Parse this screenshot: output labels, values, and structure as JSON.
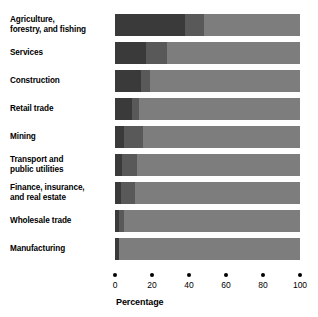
{
  "chart_data": {
    "type": "bar",
    "subtype": "stacked-horizontal-100",
    "title": "",
    "xlabel": "Percentage",
    "ylabel": "",
    "xlim": [
      0,
      100
    ],
    "grid": false,
    "legend": "none",
    "tick_values": [
      0,
      20,
      40,
      60,
      80,
      100
    ],
    "tick_labels": [
      "0",
      "20",
      "40",
      "60",
      "80",
      "100"
    ],
    "categories": [
      "Agriculture,\nforestry, and fishing",
      "Services",
      "Construction",
      "Retail trade",
      "Mining",
      "Transport and\npublic utilities",
      "Finance, insurance,\nand real estate",
      "Wholesale trade",
      "Manufacturing"
    ],
    "series": [
      {
        "name": "segment-1",
        "color": "#3a3a3a",
        "values": [
          38,
          17,
          14,
          9,
          5,
          4,
          3,
          2,
          2
        ]
      },
      {
        "name": "segment-2",
        "color": "#595959",
        "values": [
          10,
          11,
          5,
          4,
          10,
          8,
          8,
          3,
          0
        ]
      },
      {
        "name": "segment-3",
        "color": "#7d7d7d",
        "values": [
          52,
          72,
          81,
          87,
          85,
          88,
          89,
          95,
          98
        ]
      }
    ]
  },
  "axis": {
    "title": "Percentage",
    "ticks": [
      {
        "value": 0,
        "label": "0"
      },
      {
        "value": 20,
        "label": "20"
      },
      {
        "value": 40,
        "label": "40"
      },
      {
        "value": 60,
        "label": "60"
      },
      {
        "value": 80,
        "label": "80"
      },
      {
        "value": 100,
        "label": "100"
      }
    ]
  },
  "rows": [
    {
      "label": "Agriculture,\nforestry, and fishing",
      "segments": [
        {
          "value": 38,
          "color": "#3a3a3a"
        },
        {
          "value": 10,
          "color": "#595959"
        },
        {
          "value": 52,
          "color": "#7d7d7d"
        }
      ]
    },
    {
      "label": "Services",
      "segments": [
        {
          "value": 17,
          "color": "#3a3a3a"
        },
        {
          "value": 11,
          "color": "#595959"
        },
        {
          "value": 72,
          "color": "#7d7d7d"
        }
      ]
    },
    {
      "label": "Construction",
      "segments": [
        {
          "value": 14,
          "color": "#3a3a3a"
        },
        {
          "value": 5,
          "color": "#595959"
        },
        {
          "value": 81,
          "color": "#7d7d7d"
        }
      ]
    },
    {
      "label": "Retail trade",
      "segments": [
        {
          "value": 9,
          "color": "#3a3a3a"
        },
        {
          "value": 4,
          "color": "#595959"
        },
        {
          "value": 87,
          "color": "#7d7d7d"
        }
      ]
    },
    {
      "label": "Mining",
      "segments": [
        {
          "value": 5,
          "color": "#3a3a3a"
        },
        {
          "value": 10,
          "color": "#595959"
        },
        {
          "value": 85,
          "color": "#7d7d7d"
        }
      ]
    },
    {
      "label": "Transport and\npublic utilities",
      "segments": [
        {
          "value": 4,
          "color": "#3a3a3a"
        },
        {
          "value": 8,
          "color": "#595959"
        },
        {
          "value": 88,
          "color": "#7d7d7d"
        }
      ]
    },
    {
      "label": "Finance, insurance,\nand real estate",
      "segments": [
        {
          "value": 3,
          "color": "#3a3a3a"
        },
        {
          "value": 8,
          "color": "#595959"
        },
        {
          "value": 89,
          "color": "#7d7d7d"
        }
      ]
    },
    {
      "label": "Wholesale trade",
      "segments": [
        {
          "value": 2,
          "color": "#3a3a3a"
        },
        {
          "value": 3,
          "color": "#595959"
        },
        {
          "value": 95,
          "color": "#7d7d7d"
        }
      ]
    },
    {
      "label": "Manufacturing",
      "segments": [
        {
          "value": 2,
          "color": "#3a3a3a"
        },
        {
          "value": 0,
          "color": "#595959"
        },
        {
          "value": 98,
          "color": "#7d7d7d"
        }
      ]
    }
  ]
}
